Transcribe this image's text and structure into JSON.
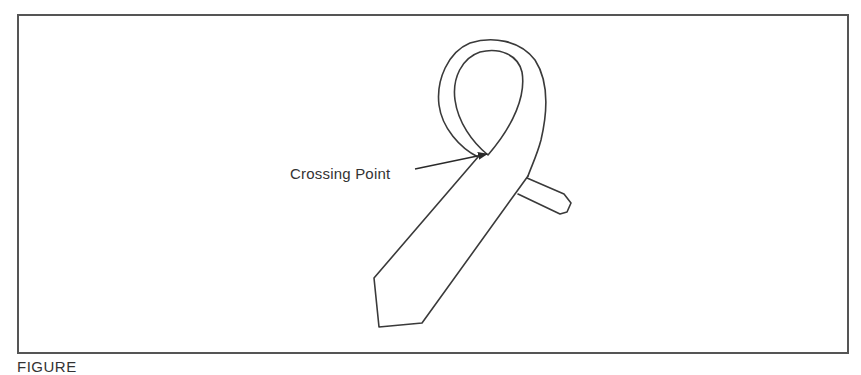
{
  "figure": {
    "label": "Crossing Point",
    "caption": "FIGURE",
    "colors": {
      "line": "#3a3a3a",
      "frame": "#555555",
      "background": "#ffffff",
      "text": "#333333"
    }
  }
}
